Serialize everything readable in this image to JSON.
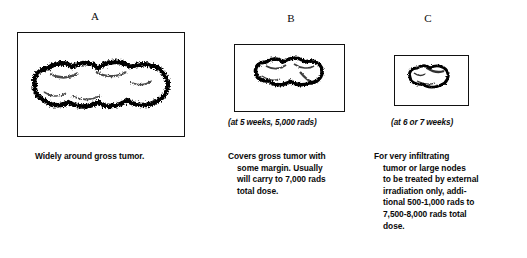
{
  "figure": {
    "background_color": "#ffffff",
    "ink_color": "#000000",
    "panel_count": 3
  },
  "panels": [
    {
      "letter": "A",
      "icon_name": "tumor-blob-large-icon",
      "frame": {
        "x": 17,
        "y": 32,
        "width": 168,
        "height": 105
      },
      "letter_pos": {
        "x": 94,
        "y": 11
      },
      "sub_caption": "",
      "body_lines": [
        {
          "text": "Widely around gross tumor.",
          "indent": false
        }
      ],
      "body_pos": {
        "x": 35,
        "y": 151
      }
    },
    {
      "letter": "B",
      "icon_name": "tumor-blob-medium-icon",
      "frame": {
        "x": 234,
        "y": 44,
        "width": 111,
        "height": 68
      },
      "letter_pos": {
        "x": 290,
        "y": 13
      },
      "sub_caption": "(at 5 weeks, 5,000 rads)",
      "sub_caption_pos": {
        "x": 228,
        "y": 118
      },
      "body_lines": [
        {
          "text": "Covers gross tumor with",
          "indent": false
        },
        {
          "text": "some margin. Usually",
          "indent": true
        },
        {
          "text": "will carry to 7,000 rads",
          "indent": true
        },
        {
          "text": "total dose.",
          "indent": true
        }
      ],
      "body_pos": {
        "x": 228,
        "y": 151
      }
    },
    {
      "letter": "C",
      "icon_name": "tumor-blob-small-icon",
      "frame": {
        "x": 394,
        "y": 55,
        "width": 75,
        "height": 51
      },
      "letter_pos": {
        "x": 427,
        "y": 13
      },
      "sub_caption": "(at 6 or 7 weeks)",
      "sub_caption_pos": {
        "x": 391,
        "y": 118
      },
      "body_lines": [
        {
          "text": "For very infiltrating",
          "indent": false
        },
        {
          "text": "tumor or large nodes",
          "indent": true
        },
        {
          "text": "to be treated by external",
          "indent": true
        },
        {
          "text": "irradiation only, addi-",
          "indent": true
        },
        {
          "text": "tional 500-1,000 rads to",
          "indent": true
        },
        {
          "text": "7,500-8,000 rads total",
          "indent": true
        },
        {
          "text": "dose.",
          "indent": true
        }
      ],
      "body_pos": {
        "x": 374,
        "y": 151
      }
    }
  ]
}
